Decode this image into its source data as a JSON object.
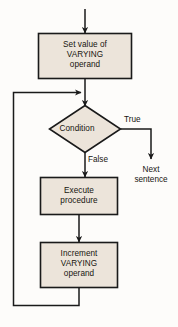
{
  "diagram": {
    "background_color": "#fdfcfa",
    "node_fill_color": "#ece4da",
    "node_border_color": "#1a1a1a",
    "line_color": "#1a1a1a",
    "text_color": "#17150f",
    "nodes": [
      {
        "id": "set-value",
        "shape": "process",
        "label": "Set value of\nVARYING\noperand"
      },
      {
        "id": "condition",
        "shape": "decision",
        "label": "Condition"
      },
      {
        "id": "execute",
        "shape": "process",
        "label": "Execute\nprocedure"
      },
      {
        "id": "increment",
        "shape": "process",
        "label": "Increment\nVARYING\noperand"
      },
      {
        "id": "next-sentence",
        "shape": "text",
        "label": "Next\nsentence"
      }
    ],
    "edge_labels": {
      "true": "True",
      "false": "False"
    }
  }
}
